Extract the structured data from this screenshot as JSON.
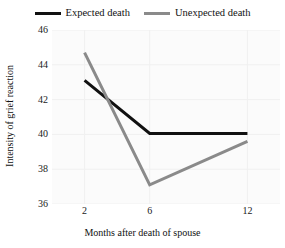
{
  "chart_data": {
    "type": "line",
    "title": "",
    "subtitle": "",
    "xlabel": "Months after death of spouse",
    "ylabel": "Intensity of grief reaction",
    "x": [
      2,
      6,
      12
    ],
    "categories": [
      "2",
      "6",
      "12"
    ],
    "xtick_labels": [
      "2",
      "6",
      "12"
    ],
    "ytick_labels": [
      "36",
      "38",
      "40",
      "42",
      "44",
      "46"
    ],
    "yticks": [
      36,
      38,
      40,
      42,
      44,
      46
    ],
    "ylim": [
      36,
      46
    ],
    "xlim": [
      0,
      14
    ],
    "grid": true,
    "legend_position": "top-center",
    "series": [
      {
        "name": "Expected death",
        "values": [
          43.1,
          40.05,
          40.05
        ],
        "color": "#111111",
        "width": 3.0
      },
      {
        "name": "Unexpected death",
        "values": [
          44.7,
          37.1,
          39.6
        ],
        "color": "#8a8a8a",
        "width": 3.0
      }
    ],
    "annotations": []
  },
  "legend": {
    "entries": [
      {
        "label": "Expected death",
        "swatch_name": "legend-swatch-expected-death"
      },
      {
        "label": "Unexpected death",
        "swatch_name": "legend-swatch-unexpected-death"
      }
    ]
  },
  "colors": {
    "expected_death": "#111111",
    "unexpected_death": "#8a8a8a",
    "plot_background": "#fbfbfb",
    "grid": "#f0f0f0",
    "text": "#111111",
    "page_background": "#ffffff"
  }
}
